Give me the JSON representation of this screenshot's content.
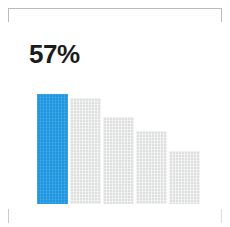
{
  "card": {
    "background_color": "#ffffff",
    "frame": {
      "style": "corner-brackets",
      "color": "#b9bcbe"
    }
  },
  "metric": {
    "value_label": "57%",
    "value": 57,
    "unit": "%",
    "color": "#1c1c1c"
  },
  "colors": {
    "highlight": "#1f96e0",
    "muted": "#dedfe0",
    "text": "#1c1c1c",
    "frame": "#b9bcbe"
  },
  "chart_data": {
    "type": "bar",
    "title": "",
    "xlabel": "",
    "ylabel": "",
    "grid": false,
    "legend": null,
    "categories": [
      "1",
      "2",
      "3",
      "4",
      "5"
    ],
    "values": [
      57,
      54,
      44,
      37,
      27
    ],
    "ylim": [
      0,
      60
    ],
    "highlight_index": 0,
    "bars": [
      {
        "category": "1",
        "value": 57,
        "color": "#1f96e0",
        "highlighted": true,
        "x": 0,
        "width": 31,
        "height": 110
      },
      {
        "category": "2",
        "value": 54,
        "color": "#dedfe0",
        "highlighted": false,
        "x": 33,
        "width": 31,
        "height": 106
      },
      {
        "category": "3",
        "value": 44,
        "color": "#dedfe0",
        "highlighted": false,
        "x": 66,
        "width": 31,
        "height": 87
      },
      {
        "category": "4",
        "value": 37,
        "color": "#dedfe0",
        "highlighted": false,
        "x": 99,
        "width": 31,
        "height": 73
      },
      {
        "category": "5",
        "value": 27,
        "color": "#dedfe0",
        "highlighted": false,
        "x": 132,
        "width": 31,
        "height": 53
      }
    ]
  }
}
